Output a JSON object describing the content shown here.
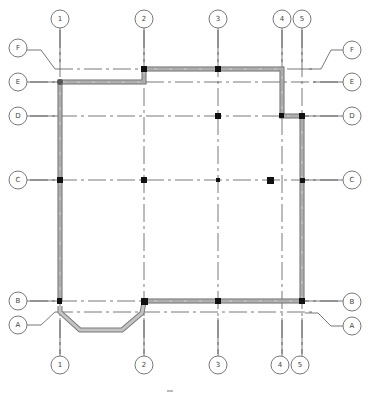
{
  "drawing": {
    "type": "structural grid floor plan",
    "colors": {
      "grid_line": "#555555",
      "wall_fill": "#b5b5b5",
      "wall_edge": "#6a6a6a",
      "column": "#111111",
      "bubble_stroke": "#555555"
    }
  },
  "columns": [
    {
      "label": "1",
      "x": 60
    },
    {
      "label": "2",
      "x": 144
    },
    {
      "label": "3",
      "x": 218
    },
    {
      "label": "4",
      "x": 282
    },
    {
      "label": "5",
      "x": 302
    }
  ],
  "rows": [
    {
      "label": "F",
      "y": 69
    },
    {
      "label": "E",
      "y": 82
    },
    {
      "label": "D",
      "y": 116
    },
    {
      "label": "C",
      "y": 180
    },
    {
      "label": "B",
      "y": 301
    },
    {
      "label": "A",
      "y": 312
    }
  ],
  "labels": {
    "top": [
      "1",
      "2",
      "3",
      "4",
      "5"
    ],
    "bottom": [
      "1",
      "2",
      "3",
      "4",
      "5"
    ],
    "left": [
      "F",
      "E",
      "D",
      "C",
      "B",
      "A"
    ],
    "right": [
      "F",
      "E",
      "D",
      "C",
      "B",
      "A"
    ]
  }
}
